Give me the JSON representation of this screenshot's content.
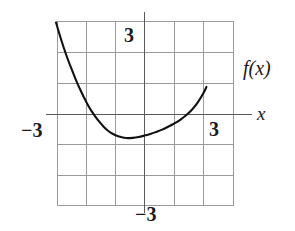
{
  "figure": {
    "kind": "cartesian-plot",
    "title": "",
    "labels": {
      "function_label": "f(x)",
      "x_axis_label": "x",
      "x_tick_positive": "3",
      "x_tick_negative": "−3",
      "y_tick_positive": "3",
      "y_tick_negative": "−3"
    },
    "colors": {
      "curve": "#111111",
      "axis": "#5a5a5a",
      "grid": "#9a9a9a",
      "background": "#ffffff",
      "text": "#1a1a1a"
    }
  },
  "chart_data": {
    "type": "line",
    "title": "",
    "xlabel": "x",
    "ylabel": "f(x)",
    "xlim": [
      -5,
      3.4
    ],
    "ylim": [
      -3.9,
      3.9
    ],
    "grid": true,
    "grid_step_x": 1.5,
    "grid_step_y": 1.5,
    "legend": "f(x)",
    "legend_position": "right-of-curve-end",
    "x_ticks": [
      -3,
      3
    ],
    "y_ticks": [
      -3,
      3
    ],
    "x_tick_labels": [
      "−3",
      "3"
    ],
    "y_tick_labels": [
      "−3",
      "3"
    ],
    "annotations": [
      {
        "text": "f(x)",
        "x": 3.6,
        "y": 2.4
      },
      {
        "text": "x",
        "x": 4.3,
        "y": 0.1
      }
    ],
    "series": [
      {
        "name": "f(x)",
        "x": [
          -4.5,
          -4.3,
          -4.1,
          -3.9,
          -3.7,
          -3.5,
          -3.3,
          -3.1,
          -2.9,
          -2.7,
          -2.5,
          -2.3,
          -2.1,
          -1.9,
          -1.7,
          -1.5,
          -1.2,
          -0.9,
          -0.6,
          -0.3,
          0.0,
          0.3,
          0.6,
          0.9,
          1.2,
          1.5,
          1.8,
          2.1,
          2.4,
          2.7,
          3.0,
          3.15
        ],
        "y": [
          4.5,
          3.85,
          3.25,
          2.7,
          2.2,
          1.72,
          1.28,
          0.88,
          0.5,
          0.18,
          -0.1,
          -0.35,
          -0.57,
          -0.76,
          -0.9,
          -1.0,
          -1.1,
          -1.15,
          -1.14,
          -1.1,
          -1.03,
          -0.95,
          -0.85,
          -0.74,
          -0.6,
          -0.45,
          -0.27,
          -0.05,
          0.22,
          0.58,
          1.05,
          1.35
        ]
      }
    ]
  }
}
